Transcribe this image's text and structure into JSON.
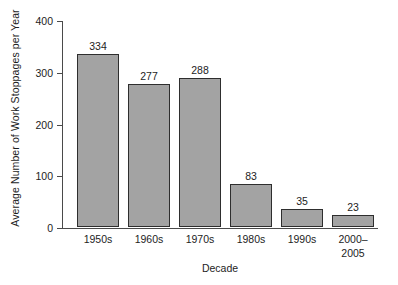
{
  "chart_data": {
    "type": "bar",
    "title": "",
    "xlabel": "Decade",
    "ylabel": "Average Number of Work Stoppages per Year",
    "categories": [
      "1950s",
      "1960s",
      "1970s",
      "1980s",
      "1990s",
      "2000–\n2005"
    ],
    "values": [
      334,
      277,
      288,
      83,
      35,
      23
    ],
    "value_labels": [
      "334",
      "277",
      "288",
      "83",
      "35",
      "23"
    ],
    "ylim": [
      0,
      400
    ],
    "yticks": [
      0,
      100,
      200,
      300,
      400
    ],
    "ytick_labels": [
      "0",
      "100",
      "200",
      "300",
      "400"
    ],
    "grid": false,
    "legend": false,
    "bar_fill_color": "#a3a3a3",
    "bar_edge_color": "#2e2e2e",
    "axis_color": "#4a4a4a",
    "text_color": "#1d1d1d",
    "background_color": "#ffffff"
  }
}
